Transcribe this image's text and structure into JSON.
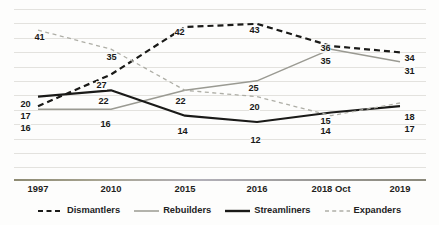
{
  "chart_data": {
    "type": "line",
    "title": "",
    "subtitle": "",
    "xlabel": "",
    "ylabel": "",
    "categories": [
      "1997",
      "2010",
      "2015",
      "2016",
      "2018 Oct",
      "2019"
    ],
    "ylim": [
      0,
      48
    ],
    "grid": true,
    "grid_horizontal_lines": 12,
    "legend_position": "bottom",
    "series": [
      {
        "name": "Dismantlers",
        "values": [
          17,
          27,
          42,
          43,
          36,
          34
        ],
        "color": "#1a1a18",
        "style": "dashed",
        "width": 2.2
      },
      {
        "name": "Rebuilders",
        "values": [
          16,
          16,
          22,
          25,
          35,
          31
        ],
        "color": "#9a9a92",
        "style": "solid",
        "width": 1.5
      },
      {
        "name": "Streamliners",
        "values": [
          20,
          22,
          14,
          12,
          15,
          17
        ],
        "color": "#1a1a18",
        "style": "solid",
        "width": 2.2
      },
      {
        "name": "Expanders",
        "values": [
          41,
          35,
          22,
          20,
          14,
          18
        ],
        "color": "#aeaea6",
        "style": "dashed",
        "width": 1.3
      }
    ],
    "point_labels": [
      {
        "text": "41",
        "x": 34,
        "y": 33,
        "series": "Expanders",
        "category": "1997"
      },
      {
        "text": "20",
        "x": 20,
        "y": 100,
        "series": "Streamliners",
        "category": "1997"
      },
      {
        "text": "17",
        "x": 20,
        "y": 112,
        "series": "Dismantlers",
        "category": "1997"
      },
      {
        "text": "16",
        "x": 20,
        "y": 124,
        "series": "Rebuilders",
        "category": "1997"
      },
      {
        "text": "35",
        "x": 106,
        "y": 53,
        "series": "Expanders",
        "category": "2010"
      },
      {
        "text": "27",
        "x": 96,
        "y": 81,
        "series": "Dismantlers",
        "category": "2010"
      },
      {
        "text": "22",
        "x": 98,
        "y": 97,
        "series": "Streamliners",
        "category": "2010"
      },
      {
        "text": "16",
        "x": 100,
        "y": 120,
        "series": "Rebuilders",
        "category": "2010"
      },
      {
        "text": "42",
        "x": 174,
        "y": 28,
        "series": "Dismantlers",
        "category": "2015"
      },
      {
        "text": "22",
        "x": 175,
        "y": 97,
        "series": "Rebuilders",
        "category": "2015"
      },
      {
        "text": "14",
        "x": 177,
        "y": 127,
        "series": "Streamliners",
        "category": "2015"
      },
      {
        "text": "43",
        "x": 249,
        "y": 26,
        "series": "Dismantlers",
        "category": "2016"
      },
      {
        "text": "25",
        "x": 248,
        "y": 84,
        "series": "Rebuilders",
        "category": "2016"
      },
      {
        "text": "20",
        "x": 249,
        "y": 103,
        "series": "Expanders",
        "category": "2016"
      },
      {
        "text": "12",
        "x": 250,
        "y": 136,
        "series": "Streamliners",
        "category": "2016"
      },
      {
        "text": "36",
        "x": 320,
        "y": 44,
        "series": "Dismantlers",
        "category": "2018 Oct"
      },
      {
        "text": "35",
        "x": 320,
        "y": 57,
        "series": "Rebuilders",
        "category": "2018 Oct"
      },
      {
        "text": "15",
        "x": 320,
        "y": 117,
        "series": "Streamliners",
        "category": "2018 Oct"
      },
      {
        "text": "14",
        "x": 320,
        "y": 127,
        "series": "Expanders",
        "category": "2018 Oct"
      },
      {
        "text": "34",
        "x": 404,
        "y": 54,
        "series": "Dismantlers",
        "category": "2019"
      },
      {
        "text": "31",
        "x": 404,
        "y": 67,
        "series": "Rebuilders",
        "category": "2019"
      },
      {
        "text": "18",
        "x": 404,
        "y": 113,
        "series": "Expanders",
        "category": "2019"
      },
      {
        "text": "17",
        "x": 404,
        "y": 125,
        "series": "Streamliners",
        "category": "2019"
      }
    ]
  },
  "axis": {
    "ticks": [
      {
        "label": "1997",
        "x": 38
      },
      {
        "label": "2010",
        "x": 111
      },
      {
        "label": "2015",
        "x": 185
      },
      {
        "label": "2016",
        "x": 257
      },
      {
        "label": "2018 Oct",
        "x": 331
      },
      {
        "label": "2019",
        "x": 400
      }
    ]
  },
  "legend": {
    "items": [
      {
        "label": "Dismantlers",
        "color": "#1a1a18",
        "style": "dashed",
        "width": 2.2
      },
      {
        "label": "Rebuilders",
        "color": "#9a9a92",
        "style": "solid",
        "width": 1.5
      },
      {
        "label": "Streamliners",
        "color": "#1a1a18",
        "style": "solid",
        "width": 2.4
      },
      {
        "label": "Expanders",
        "color": "#aeaea6",
        "style": "dashed",
        "width": 1.3
      }
    ]
  }
}
